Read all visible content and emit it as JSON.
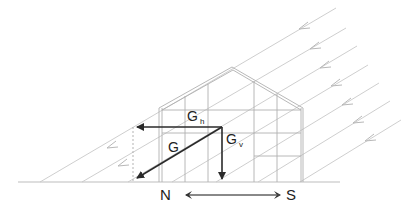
{
  "diagram": {
    "labels": {
      "G": "G",
      "Gh_main": "G",
      "Gh_sub": "h",
      "Gv_main": "G",
      "Gv_sub": "v",
      "north": "N",
      "south": "S"
    },
    "colors": {
      "rays": "#c4c4c4",
      "structure": "#b0b0b0",
      "vectors": "#2a2a2a",
      "ground": "#bdbdbd",
      "dotted": "#aaaaaa"
    }
  }
}
